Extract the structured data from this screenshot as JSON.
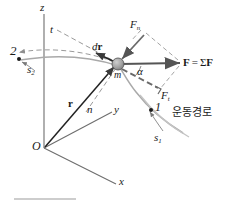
{
  "figure": {
    "axes": {
      "x_label": "x",
      "y_label": "y",
      "z_label": "z",
      "origin_label": "O"
    },
    "labels": {
      "position_vector": "r",
      "displacement": "dr",
      "displacement_d": "d",
      "mass": "m",
      "force_resultant": "F = ΣF",
      "force_resultant_bold_f": "F",
      "force_resultant_eq": "=",
      "force_resultant_sigma": "Σ",
      "normal_force": "F",
      "normal_force_sub": "n",
      "tangential_force": "F",
      "tangential_force_sub": "t",
      "angle": "α",
      "normal_axis": "n",
      "tangential_axis": "t",
      "point_start": "1",
      "point_end": "2",
      "arc_length_start": "s",
      "arc_length_start_sub": "1",
      "arc_length_end": "s",
      "arc_length_end_sub": "2",
      "path_caption": "운동경로"
    },
    "colors": {
      "ink": "#1a1a1a",
      "axis_line": "#6e6e6e",
      "path_curve": "#a9a9a9",
      "dashed_construction": "#9a9a9a",
      "force_arrow": "#555555",
      "particle_fill": "#9c9c9c",
      "particle_stroke": "#5a5a5a",
      "rule": "#bdbdbd",
      "background": "#ffffff"
    }
  }
}
